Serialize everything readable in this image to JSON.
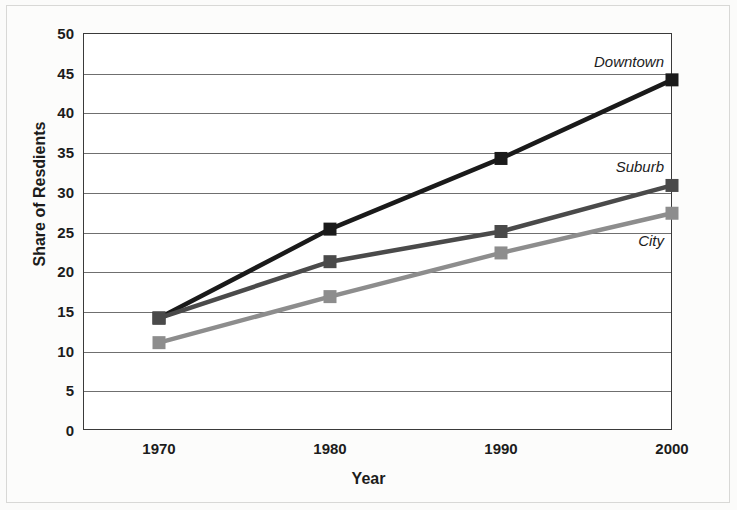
{
  "chart_data": {
    "type": "line",
    "title": "",
    "xlabel": "Year",
    "ylabel": "Share of Resdients",
    "categories": [
      "1970",
      "1980",
      "1990",
      "2000"
    ],
    "x": [
      1970,
      1980,
      1990,
      2000
    ],
    "ylim": [
      0,
      50
    ],
    "yticks": [
      "0",
      "5",
      "10",
      "15",
      "20",
      "25",
      "30",
      "35",
      "40",
      "45",
      "50"
    ],
    "ytick_values": [
      0,
      5,
      10,
      15,
      20,
      25,
      30,
      35,
      40,
      45,
      50
    ],
    "grid": "horizontal",
    "legend_position": "inline-right",
    "series": [
      {
        "name": "Downtown",
        "values": [
          14.1,
          25.3,
          34.2,
          44.1
        ],
        "color": "#1a1a1a",
        "marker": "square"
      },
      {
        "name": "Suburb",
        "values": [
          14.1,
          21.2,
          25.0,
          30.8
        ],
        "color": "#4a4a4a",
        "marker": "square"
      },
      {
        "name": "City",
        "values": [
          11.0,
          16.8,
          22.3,
          27.3
        ],
        "color": "#8d8d8d",
        "marker": "square"
      }
    ],
    "annotations": [
      {
        "text": "Downtown",
        "series": "Downtown",
        "at_x": "2000"
      },
      {
        "text": "Suburb",
        "series": "Suburb",
        "at_x": "2000"
      },
      {
        "text": "City",
        "series": "City",
        "at_x": "2000"
      }
    ]
  },
  "axes": {
    "frame_color": "#3a3a3a",
    "grid_color": "#6f6f6f"
  }
}
